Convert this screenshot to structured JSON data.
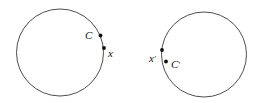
{
  "figure": {
    "type": "geometry-diagram",
    "background_color": "#ffffff",
    "stroke_color": "#3a3a3a",
    "dot_color": "#111111",
    "label_color": "#111111",
    "width": 261,
    "height": 103,
    "shapes": [
      {
        "name": "left-circle",
        "cx": 60,
        "cy": 52.5,
        "r": 43.5
      },
      {
        "name": "right-circle",
        "cx": 204,
        "cy": 54.5,
        "r": 42.5
      }
    ],
    "points": [
      {
        "name": "point-C",
        "label": "C",
        "prime": "",
        "cx": 100.5,
        "cy": 35.5,
        "r": 1.9,
        "label_x": 85,
        "label_y": 39,
        "label_anchor": "start"
      },
      {
        "name": "point-x",
        "label": "x",
        "prime": "",
        "cx": 104.0,
        "cy": 48.0,
        "r": 1.9,
        "label_x": 108,
        "label_y": 57,
        "label_anchor": "start"
      },
      {
        "name": "point-x-prime",
        "label": "x",
        "prime": "′",
        "cx": 162.0,
        "cy": 50.0,
        "r": 1.9,
        "label_x": 149,
        "label_y": 62,
        "label_anchor": "start"
      },
      {
        "name": "point-C-prime",
        "label": "C",
        "prime": "′",
        "cx": 166.0,
        "cy": 61.5,
        "r": 1.9,
        "label_x": 171,
        "label_y": 68,
        "label_anchor": "start"
      }
    ]
  }
}
